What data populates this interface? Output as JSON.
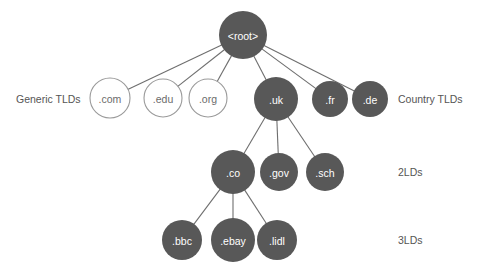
{
  "diagram": {
    "type": "tree",
    "background_color": "#ffffff",
    "node_fill_color": "#585858",
    "node_open_fill_color": "#ffffff",
    "node_stroke_color": "#9a9a9a",
    "edge_color": "#6e6e6e",
    "label_light_color": "#ffffff",
    "label_dark_color": "#6b6b6b",
    "side_label_color": "#555555",
    "nodes": [
      {
        "id": "root",
        "label": "<root>",
        "cx": 243,
        "cy": 35,
        "r": 24,
        "style": "filled",
        "level": "root"
      },
      {
        "id": "com",
        "label": ".com",
        "cx": 110,
        "cy": 98,
        "r": 20,
        "style": "open",
        "level": "tld"
      },
      {
        "id": "edu",
        "label": ".edu",
        "cx": 163,
        "cy": 98,
        "r": 19,
        "style": "open",
        "level": "tld"
      },
      {
        "id": "org",
        "label": ".org",
        "cx": 208,
        "cy": 98,
        "r": 19,
        "style": "open",
        "level": "tld"
      },
      {
        "id": "uk",
        "label": ".uk",
        "cx": 276,
        "cy": 99,
        "r": 22,
        "style": "filled",
        "level": "tld"
      },
      {
        "id": "fr",
        "label": ".fr",
        "cx": 330,
        "cy": 99,
        "r": 18,
        "style": "filled",
        "level": "tld"
      },
      {
        "id": "de",
        "label": ".de",
        "cx": 370,
        "cy": 99,
        "r": 18,
        "style": "filled",
        "level": "tld"
      },
      {
        "id": "co",
        "label": ".co",
        "cx": 233,
        "cy": 172,
        "r": 22,
        "style": "filled",
        "level": "2ld"
      },
      {
        "id": "gov",
        "label": ".gov",
        "cx": 279,
        "cy": 172,
        "r": 19,
        "style": "filled",
        "level": "2ld"
      },
      {
        "id": "sch",
        "label": ".sch",
        "cx": 325,
        "cy": 172,
        "r": 19,
        "style": "filled",
        "level": "2ld"
      },
      {
        "id": "bbc",
        "label": ".bbc",
        "cx": 182,
        "cy": 240,
        "r": 20,
        "style": "filled",
        "level": "3ld"
      },
      {
        "id": "ebay",
        "label": ".ebay",
        "cx": 233,
        "cy": 240,
        "r": 22,
        "style": "filled",
        "level": "3ld"
      },
      {
        "id": "lidl",
        "label": ".lidl",
        "cx": 277,
        "cy": 240,
        "r": 20,
        "style": "filled",
        "level": "3ld"
      }
    ],
    "edges": [
      {
        "from": "root",
        "to": "com"
      },
      {
        "from": "root",
        "to": "edu"
      },
      {
        "from": "root",
        "to": "org"
      },
      {
        "from": "root",
        "to": "uk"
      },
      {
        "from": "root",
        "to": "fr"
      },
      {
        "from": "root",
        "to": "de"
      },
      {
        "from": "uk",
        "to": "co"
      },
      {
        "from": "uk",
        "to": "gov"
      },
      {
        "from": "uk",
        "to": "sch"
      },
      {
        "from": "co",
        "to": "bbc"
      },
      {
        "from": "co",
        "to": "ebay"
      },
      {
        "from": "co",
        "to": "lidl"
      }
    ],
    "side_labels": [
      {
        "id": "generic-tlds",
        "text": "Generic TLDs",
        "x": 16,
        "y": 99,
        "side": "left"
      },
      {
        "id": "country-tlds",
        "text": "Country TLDs",
        "x": 398,
        "y": 99,
        "side": "right"
      },
      {
        "id": "second-level",
        "text": "2LDs",
        "x": 398,
        "y": 172,
        "side": "right"
      },
      {
        "id": "third-level",
        "text": "3LDs",
        "x": 398,
        "y": 240,
        "side": "right"
      }
    ]
  }
}
